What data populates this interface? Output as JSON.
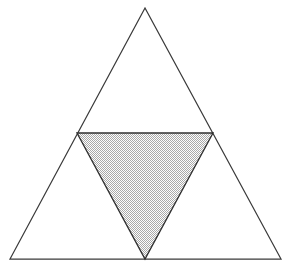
{
  "figure": {
    "background_color": "#ffffff",
    "stroke_color": "#3a3a3a",
    "stroke_width": 1.2,
    "fill_pattern_color": "#b5b5b5",
    "fill_pattern_background": "#fbfbfb",
    "canvas": {
      "width": 292,
      "height": 267
    }
  },
  "shapes": {
    "outer_triangle": {
      "name": "outer-triangle",
      "label": "Outer equilateral triangle",
      "points": "145,8 281,259 10,259",
      "vertices": [
        {
          "name": "apex",
          "x": 145,
          "y": 8
        },
        {
          "name": "bottom-right",
          "x": 281,
          "y": 259
        },
        {
          "name": "bottom-left",
          "x": 10,
          "y": 259
        }
      ],
      "fill": "none",
      "stroke": "#3a3a3a"
    },
    "inner_triangle": {
      "name": "inner-medial-triangle",
      "label": "Shaded inverted medial triangle",
      "points": "77,133 213,133 145,259",
      "vertices": [
        {
          "name": "midpoint-left-side",
          "x": 77,
          "y": 133
        },
        {
          "name": "midpoint-right-side",
          "x": 213,
          "y": 133
        },
        {
          "name": "midpoint-base",
          "x": 145,
          "y": 259
        }
      ],
      "fill": "stipple-pattern",
      "stroke": "#2f2f2f"
    }
  },
  "pattern": {
    "name": "stipple-checker",
    "tile_size": 2,
    "dot_color": "#a8a8a8",
    "gap_color": "#fcfcfc"
  },
  "labels": {
    "caption": ""
  }
}
